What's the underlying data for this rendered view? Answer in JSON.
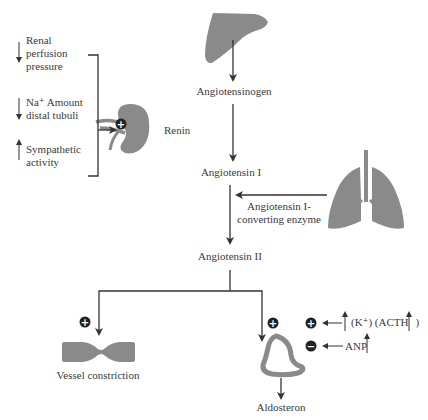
{
  "colors": {
    "organ_fill": "#8a8a8a",
    "arrow": "#333333",
    "text": "#3a3a3a",
    "sign_fill": "#222222"
  },
  "stimuli": [
    {
      "direction": "down",
      "lines": [
        "Renal",
        "perfusion",
        "pressure"
      ]
    },
    {
      "direction": "down",
      "lines": [
        "Na⁺ Amount",
        "distal tubuli"
      ]
    },
    {
      "direction": "up",
      "lines": [
        "Sympathetic",
        "activity"
      ]
    }
  ],
  "nodes": {
    "liver_icon": "liver-icon",
    "angiotensinogen": "Angiotensinogen",
    "renin": "Renin",
    "kidney_icon": "kidney-icon",
    "angiotensin_1": "Angiotensin I",
    "enzyme_line1": "Angiotensin I-",
    "enzyme_line2": "converting enzyme",
    "lungs_icon": "lungs-icon",
    "angiotensin_2": "Angiotensin II",
    "vessel_icon": "vessel-icon",
    "vessel_label": "Vessel constriction",
    "adrenal_icon": "adrenal-gland-icon",
    "aldosteron": "Aldosteron"
  },
  "signs": {
    "plus": "+",
    "minus": "−"
  },
  "modulators": [
    {
      "sign": "plus",
      "text": "(K⁺) (ACTH",
      "trend": "up"
    },
    {
      "sign": "minus",
      "text": "ANP",
      "trend": "up"
    }
  ]
}
